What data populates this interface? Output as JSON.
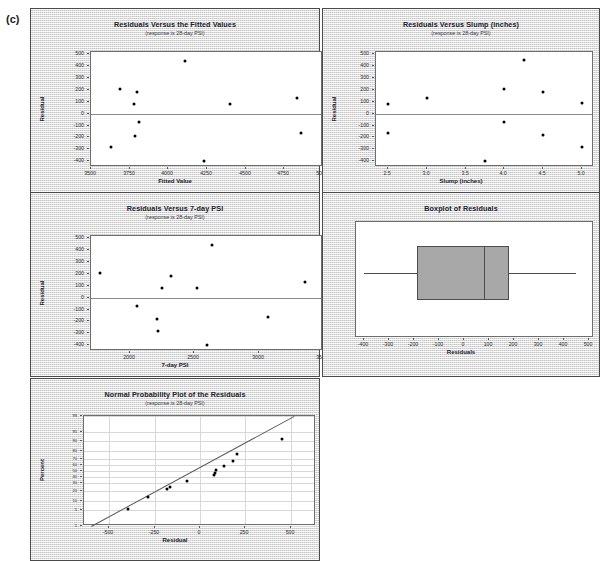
{
  "figure": {
    "label": "(c)"
  },
  "panels": {
    "fitted": {
      "title": "Residuals Versus the Fitted Values",
      "subtitle": "(response is 28-day PSI)",
      "xlabel": "Fitted Value",
      "ylabel": "Residual"
    },
    "slump": {
      "title": "Residuals Versus Slump (inches)",
      "subtitle": "(response is 28-day PSI)",
      "xlabel": "Slump (inches)",
      "ylabel": "Residual"
    },
    "psi7": {
      "title": "Residuals Versus 7-day PSI",
      "subtitle": "(response is 28-day PSI)",
      "xlabel": "7-day PSI",
      "ylabel": "Residual"
    },
    "boxplot": {
      "title": "Boxplot of Residuals",
      "subtitle": "",
      "xlabel": "Residuals",
      "ylabel": ""
    },
    "normal": {
      "title": "Normal Probability Plot of the Residuals",
      "subtitle": "(response is 28-day PSI)",
      "xlabel": "Residual",
      "ylabel": "Percent"
    }
  },
  "chart_data": [
    {
      "id": "fitted",
      "type": "scatter",
      "title": "Residuals Versus the Fitted Values",
      "subtitle": "(response is 28-day PSI)",
      "xlabel": "Fitted Value",
      "ylabel": "Residual",
      "xlim": [
        3500,
        5000
      ],
      "ylim": [
        -450,
        520
      ],
      "xticks": [
        3500,
        3750,
        4000,
        4250,
        4500,
        4750,
        5000
      ],
      "yticks": [
        -400,
        -300,
        -200,
        -100,
        0,
        100,
        200,
        300,
        400,
        500
      ],
      "grid": false,
      "reference_line_y": 0,
      "x": [
        3630,
        3690,
        3775,
        3785,
        3800,
        3810,
        4110,
        4230,
        4400,
        4830,
        4860
      ],
      "y": [
        -285,
        205,
        80,
        -190,
        180,
        -70,
        447,
        -397,
        85,
        135,
        -160
      ]
    },
    {
      "id": "slump",
      "type": "scatter",
      "title": "Residuals Versus Slump (inches)",
      "subtitle": "(response is 28-day PSI)",
      "xlabel": "Slump (inches)",
      "ylabel": "Residual",
      "xlim": [
        2.35,
        5.15
      ],
      "ylim": [
        -450,
        520
      ],
      "xticks": [
        2.5,
        3.0,
        3.5,
        4.0,
        4.5,
        5.0
      ],
      "yticks": [
        -400,
        -300,
        -200,
        -100,
        0,
        100,
        200,
        300,
        400,
        500
      ],
      "grid": false,
      "reference_line_y": 0,
      "x": [
        2.5,
        2.5,
        3.0,
        3.75,
        4.0,
        4.0,
        4.25,
        4.5,
        4.5,
        5.0,
        5.0
      ],
      "y": [
        80,
        -165,
        130,
        -397,
        212,
        -70,
        450,
        185,
        -178,
        88,
        -278
      ]
    },
    {
      "id": "psi7",
      "type": "scatter",
      "title": "Residuals Versus 7-day PSI",
      "subtitle": "(response is 28-day PSI)",
      "xlabel": "7-day PSI",
      "ylabel": "Residual",
      "xlim": [
        1700,
        3500
      ],
      "ylim": [
        -450,
        520
      ],
      "xticks": [
        2000,
        2500,
        3000,
        3500
      ],
      "yticks": [
        -400,
        -300,
        -200,
        -100,
        0,
        100,
        200,
        300,
        400,
        500
      ],
      "grid": false,
      "reference_line_y": 0,
      "x": [
        1770,
        2060,
        2210,
        2220,
        2250,
        2320,
        2520,
        2600,
        2640,
        3070,
        3360
      ],
      "y": [
        205,
        -68,
        -180,
        -285,
        80,
        180,
        78,
        -397,
        447,
        -160,
        130
      ]
    },
    {
      "id": "boxplot",
      "type": "boxplot",
      "title": "Boxplot of Residuals",
      "xlabel": "Residuals",
      "xlim": [
        -430,
        520
      ],
      "xticks": [
        -400,
        -300,
        -200,
        -100,
        0,
        100,
        200,
        300,
        400,
        500
      ],
      "grid": false,
      "box": {
        "min": -400,
        "q1": -185,
        "median": 80,
        "q3": 180,
        "max": 450
      },
      "box_fill": "#a8a8a8",
      "orientation": "horizontal"
    },
    {
      "id": "normal",
      "type": "scatter",
      "title": "Normal Probability Plot of the Residuals",
      "subtitle": "(response is 28-day PSI)",
      "xlabel": "Residual",
      "ylabel": "Percent",
      "xlim": [
        -640,
        640
      ],
      "xticks": [
        -500,
        -250,
        0,
        250,
        500
      ],
      "yticks": [
        1,
        5,
        10,
        20,
        30,
        40,
        50,
        60,
        70,
        80,
        90,
        95,
        99
      ],
      "ylim_percent": [
        1,
        99
      ],
      "grid": true,
      "fit_line": {
        "x0": -600,
        "y0": 1,
        "x1": 520,
        "y1": 99
      },
      "x": [
        -397,
        -285,
        -180,
        -165,
        -70,
        78,
        80,
        88,
        130,
        180,
        205,
        450
      ],
      "y_percent": [
        5.6,
        13.5,
        22.0,
        25.0,
        33.0,
        43.0,
        47.0,
        52.0,
        59.0,
        67.0,
        77.0,
        91.0
      ]
    }
  ]
}
